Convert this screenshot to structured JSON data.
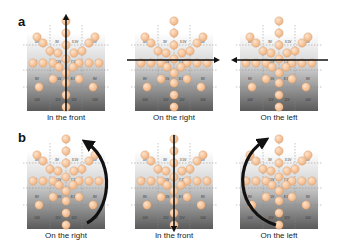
{
  "figure": {
    "rows": [
      {
        "letter": "a",
        "panels": [
          {
            "caption": "In the front",
            "arrow": "vertical-up"
          },
          {
            "caption": "On the right",
            "arrow": "horizontal-right"
          },
          {
            "caption": "On the left",
            "arrow": "horizontal-left"
          }
        ]
      },
      {
        "letter": "b",
        "panels": [
          {
            "caption": "On the right",
            "arrow": "curved-right"
          },
          {
            "caption": "In the front",
            "arrow": "vertical-down"
          },
          {
            "caption": "On the left",
            "arrow": "curved-left"
          }
        ]
      }
    ],
    "grid_labels": {
      "row1": [
        "3V",
        "3.5V"
      ],
      "row1_side": [
        "4V",
        "4V"
      ],
      "row2": [
        "7V",
        "7.5V",
        "7.5V",
        "7V"
      ],
      "row3": [
        "8V",
        "8.5V",
        "8.5V",
        "8V"
      ],
      "row4": [
        "10V",
        "11V",
        "11V",
        "10V"
      ]
    },
    "colors": {
      "sphere": "#f0b483",
      "sphere_highlight": "#fde3cc",
      "gradient_top": "#ffffff",
      "gradient_bottom": "#5a5a5a",
      "arrow": "#111111",
      "grid_line": "#888888"
    }
  }
}
